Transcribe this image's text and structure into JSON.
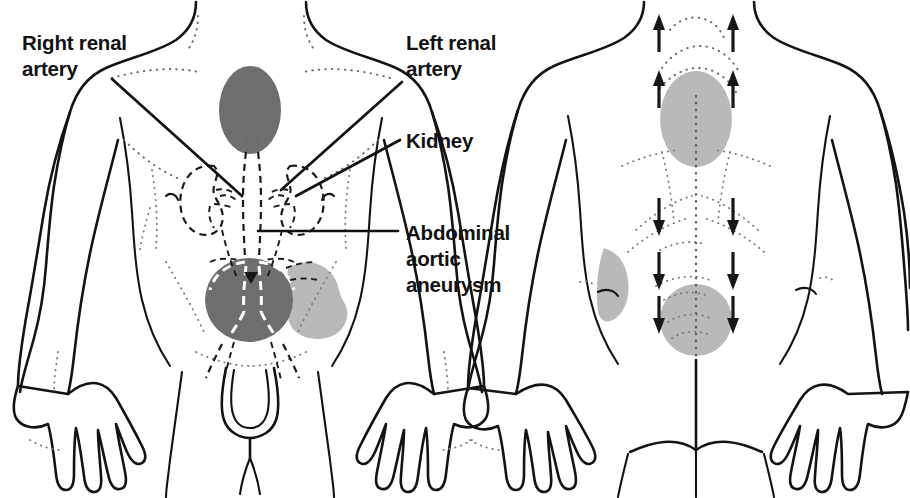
{
  "diagram": {
    "domain_type": "medical-anatomical-illustration",
    "background_color": "#ffffff",
    "ink_color": "#15120f",
    "shade_dark_color": "#6e6e6e",
    "shade_light_color": "#b9b9b9",
    "views": [
      {
        "id": "anterior",
        "name": "anterior-view",
        "description": "front view of male torso"
      },
      {
        "id": "posterior",
        "name": "posterior-view",
        "description": "back view of male torso"
      }
    ]
  },
  "labels": [
    {
      "id": "right-renal-artery",
      "lines": [
        "Right renal",
        "artery"
      ],
      "line1": "Right renal",
      "line2": "artery",
      "x": 22,
      "y": 44,
      "anchor": "start",
      "leader_from": [
        112,
        79
      ],
      "leader_to": [
        242,
        196
      ]
    },
    {
      "id": "left-renal-artery",
      "lines": [
        "Left renal",
        "artery"
      ],
      "line1": "Left renal",
      "line2": "artery",
      "x": 406,
      "y": 44,
      "anchor": "start",
      "leader_from": [
        402,
        82
      ],
      "leader_to": [
        281,
        190
      ]
    },
    {
      "id": "kidney",
      "lines": [
        "Kidney"
      ],
      "line1": "Kidney",
      "x": 406,
      "y": 148,
      "anchor": "start",
      "leader_from": [
        400,
        140
      ],
      "leader_to": [
        296,
        196
      ]
    },
    {
      "id": "abdominal-aortic-aneurysm",
      "lines": [
        "Abdominal",
        "aortic",
        "aneurysm"
      ],
      "line1": "Abdominal",
      "line2": "aortic",
      "line3": "aneurysm",
      "x": 406,
      "y": 238,
      "anchor": "start",
      "leader_from": [
        398,
        231
      ],
      "leader_to": [
        258,
        231
      ]
    }
  ],
  "shaded_regions": [
    {
      "id": "anterior-epigastric-pain",
      "name": "epigastric-shading",
      "view": "anterior",
      "tone": "dark",
      "color": "#6e6e6e",
      "shape": "ellipse",
      "cx": 250,
      "cy": 110,
      "rx": 31,
      "ry": 44
    },
    {
      "id": "anterior-aneurysm-mass",
      "name": "aneurysm-shading",
      "view": "anterior",
      "tone": "dark",
      "color": "#6e6e6e",
      "shape": "ellipse",
      "cx": 249,
      "cy": 300,
      "rx": 44,
      "ry": 42
    },
    {
      "id": "anterior-right-flank",
      "name": "flank-shading",
      "view": "anterior",
      "tone": "light",
      "color": "#b9b9b9",
      "shape": "blob",
      "cx": 316,
      "cy": 298
    },
    {
      "id": "posterior-upper-back",
      "name": "upper-back-shading",
      "view": "posterior",
      "tone": "light",
      "color": "#b9b9b9",
      "shape": "ellipse",
      "cx": 696,
      "cy": 119,
      "rx": 36,
      "ry": 48
    },
    {
      "id": "posterior-sacral",
      "name": "sacral-shading",
      "view": "posterior",
      "tone": "light",
      "color": "#b9b9b9",
      "shape": "circle",
      "cx": 696,
      "cy": 320,
      "rx": 36,
      "ry": 36
    },
    {
      "id": "posterior-left-flank",
      "name": "posterior-flank-shading",
      "view": "posterior",
      "tone": "light",
      "color": "#b9b9b9",
      "shape": "crescent",
      "cx": 612,
      "cy": 287
    }
  ],
  "arrows": {
    "description": "Radiating pain arrows on posterior view",
    "up_rows": [
      {
        "y": 36,
        "direction": "up",
        "left_x": 659,
        "right_x": 733
      },
      {
        "y": 92,
        "direction": "up",
        "left_x": 659,
        "right_x": 733
      }
    ],
    "down_rows": [
      {
        "y": 212,
        "direction": "down",
        "left_x": 659,
        "right_x": 733
      },
      {
        "y": 266,
        "direction": "down",
        "left_x": 659,
        "right_x": 733
      },
      {
        "y": 310,
        "direction": "down",
        "left_x": 659,
        "right_x": 733
      }
    ],
    "count_up": 4,
    "count_down": 6,
    "color": "#171717"
  },
  "organs": {
    "right_kidney": {
      "name": "right-kidney",
      "cx": 213,
      "cy": 198,
      "style": "dashed-outline"
    },
    "left_kidney": {
      "name": "left-kidney",
      "cx": 290,
      "cy": 198,
      "style": "dashed-outline"
    },
    "aorta": {
      "name": "abdominal-aorta",
      "style": "dashed-outline"
    },
    "bifurcation": {
      "name": "iliac-bifurcation",
      "style": "dashed-outline"
    }
  }
}
